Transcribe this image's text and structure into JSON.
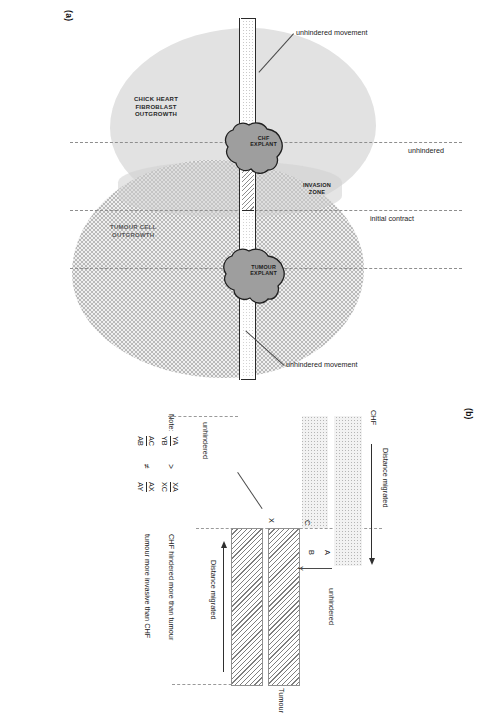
{
  "figure": {
    "panel_a_tag": "(a)",
    "panel_b_tag": "(b)"
  },
  "panel_a": {
    "chf_outgrowth_label": "CHICK HEART\nFIBROBLAST\nOUTGROWTH",
    "chf_outgrowth_label_lines": [
      "CHICK HEART",
      "FIBROBLAST",
      "OUTGROWTH"
    ],
    "tumour_outgrowth_label_lines": [
      "TUMOUR CELL",
      "OUTGROWTH"
    ],
    "chf_explant_label_lines": [
      "CHF",
      "EXPLANT"
    ],
    "tumour_explant_label_lines": [
      "TUMOUR",
      "EXPLANT"
    ],
    "invasion_zone_label_lines": [
      "INVASION",
      "ZONE"
    ],
    "initial_contact_label": "initial contract",
    "unhindered_label": "unhindered",
    "unhindered_movement_left": "unhindered movement",
    "unhindered_movement_right": "unhindered movement"
  },
  "panel_b": {
    "chf_label": "CHF",
    "tumour_label": "Tumour",
    "distance_migrated_top": "Distance migrated",
    "distance_migrated_bottom": "Distance migrated",
    "unhindered_top": "unhindered",
    "unhindered_bottom": "unhindered",
    "points": {
      "A": "A",
      "B": "B",
      "C": "C",
      "X": "X",
      "Y": "Y"
    },
    "note": {
      "title": "Note:",
      "relations": [
        {
          "left_numerator": "YA",
          "left_denominator": "YB",
          "operator": ">",
          "right_numerator": "XA",
          "right_denominator": "XC",
          "conclusion": "CHF hindered more than tumour"
        },
        {
          "left_numerator": "AC",
          "left_denominator": "AB",
          "operator": "≠",
          "right_numerator": "AX",
          "right_denominator": "AY",
          "conclusion": "tumour more invasive than CHF"
        }
      ]
    }
  },
  "colors": {
    "chf_outgrowth_fill": "#e2e2e2",
    "tumour_outgrowth_fill": "#efefef",
    "invasion_zone_fill": "#cfcfcf",
    "explant_fill": "#9e9e9e",
    "line": "#2a2a2a",
    "dashed_guide": "#8e8e8e"
  }
}
